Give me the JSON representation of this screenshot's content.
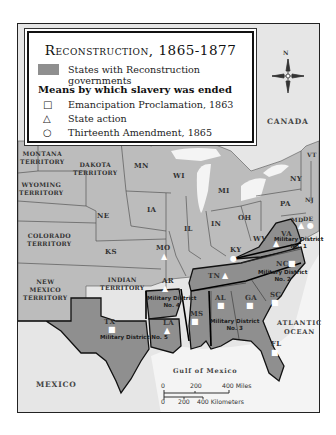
{
  "legend": {
    "title": "Reconstruction, 1865-1877",
    "swatch_label": "States with Reconstruction governments",
    "subtitle": "Means by which slavery was ended",
    "items": [
      {
        "symbol": "□",
        "icon": "square-icon",
        "label": "Emancipation Proclamation, 1863"
      },
      {
        "symbol": "△",
        "icon": "triangle-icon",
        "label": "State action"
      },
      {
        "symbol": "○",
        "icon": "circle-icon",
        "label": "Thirteenth Amendment, 1865"
      }
    ]
  },
  "colors": {
    "reconstruction_fill": "#8f8f8f",
    "other_state_fill": "#b9b9b9",
    "foreign_fill": "#e6e6e6",
    "water_fill": "#f4f4f4"
  },
  "compass": {
    "north_label": "N"
  },
  "labels": {
    "canada": "CANADA",
    "mexico": "MEXICO",
    "gulf": "Gulf of Mexico",
    "atlantic": "ATLANTIC\nOCEAN",
    "montana": "MONTANA\nTERRITORY",
    "dakota": "DAKOTA\nTERRITORY",
    "wyoming": "WYOMING\nTERRITORY",
    "colorado": "COLORADO\nTERRITORY",
    "new_mexico": "NEW\nMEXICO\nTERRITORY",
    "indian": "INDIAN\nTERRITORY",
    "states": {
      "MN": "MN",
      "WI": "WI",
      "MI": "MI",
      "IA": "IA",
      "NE": "NE",
      "KS": "KS",
      "IL": "IL",
      "IN": "IN",
      "OH": "OH",
      "MO": "MO",
      "KY": "KY",
      "WV": "WV",
      "PA": "PA",
      "NY": "NY",
      "VT": "VT",
      "NJ": "NJ",
      "MD": "MD",
      "DE": "DE",
      "VA": "VA",
      "NC": "NC",
      "SC": "SC",
      "GA": "GA",
      "FL": "FL",
      "AL": "AL",
      "MS": "MS",
      "TN": "TN",
      "AR": "AR",
      "LA": "LA",
      "TX": "TX"
    },
    "districts": {
      "d1": "Military District\nNo. 1",
      "d2": "Military District\nNo. 2",
      "d3": "Military District\nNo. 3",
      "d4": "Military District\nNo. 4",
      "d5": "Military District No. 5"
    }
  },
  "scale": {
    "miles": [
      "0",
      "200",
      "400 Miles"
    ],
    "km": [
      "0",
      "200",
      "400 Kilometers"
    ]
  }
}
